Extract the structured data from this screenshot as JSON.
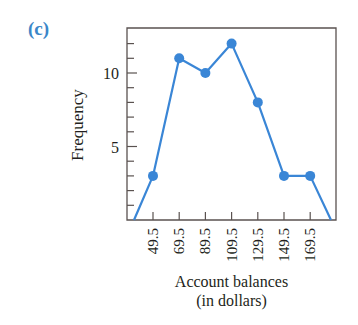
{
  "panel_label": "(c)",
  "chart_data": {
    "type": "line",
    "title": "",
    "xlabel": "Account balances (in dollars)",
    "xlabel_lines": [
      "Account balances",
      "(in dollars)"
    ],
    "ylabel": "Frequency",
    "x": [
      29.5,
      49.5,
      69.5,
      89.5,
      109.5,
      129.5,
      149.5,
      169.5,
      189.5
    ],
    "values": [
      0,
      3,
      11,
      10,
      12,
      8,
      3,
      3,
      0
    ],
    "markers_on": [
      49.5,
      69.5,
      89.5,
      109.5,
      129.5,
      149.5,
      169.5
    ],
    "x_tick_labels": [
      "49.5",
      "69.5",
      "89.5",
      "109.5",
      "129.5",
      "149.5",
      "169.5"
    ],
    "y_tick_labels": [
      "5",
      "10"
    ],
    "y_minor_ticks": [
      1,
      2,
      3,
      4,
      5,
      6,
      7,
      8,
      9,
      10,
      11,
      12
    ],
    "ylim": [
      0,
      13.5
    ],
    "xlim": [
      29.5,
      189.5
    ],
    "grid": false,
    "legend": null,
    "line_color": "#3a86d6",
    "axis_color": "#5a5250"
  }
}
